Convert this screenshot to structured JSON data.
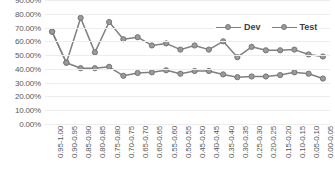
{
  "chart_data": {
    "type": "line",
    "title": "",
    "xlabel": "",
    "ylabel": "",
    "ylim": [
      0,
      0.9
    ],
    "grid": true,
    "legend_position": "top-right",
    "categories": [
      "0.95-1.00",
      "0.90-0.95",
      "0.85-0.90",
      "0.80-0.85",
      "0.75-0.80",
      "0.70-0.75",
      "0.65-0.70",
      "0.60-0.65",
      "0.55-0.60",
      "0.50-0.55",
      "0.45-0.50",
      "0.40-0.45",
      "0.35-0.40",
      "0.30-0.35",
      "0.25-0.30",
      "0.20-0.25",
      "0.15-0.20",
      "0.10-0.15",
      "0.05-0.10",
      "0.00-0.05"
    ],
    "ytick_labels": [
      "90.00%",
      "80.00%",
      "70.00%",
      "60.00%",
      "50.00%",
      "40.00%",
      "30.00%",
      "20.00%",
      "10.00%",
      "0.00%"
    ],
    "ytick_values": [
      0.9,
      0.8,
      0.7,
      0.6,
      0.5,
      0.4,
      0.3,
      0.2,
      0.1,
      0.0
    ],
    "series": [
      {
        "name": "Dev",
        "color": "#808080",
        "values": [
          0.67,
          0.445,
          0.405,
          0.405,
          0.415,
          0.35,
          0.37,
          0.375,
          0.39,
          0.365,
          0.385,
          0.385,
          0.36,
          0.34,
          0.345,
          0.345,
          0.355,
          0.375,
          0.365,
          0.33
        ]
      },
      {
        "name": "Test",
        "color": "#808080",
        "values": [
          0.67,
          0.445,
          0.77,
          0.52,
          0.74,
          0.615,
          0.63,
          0.57,
          0.585,
          0.54,
          0.57,
          0.54,
          0.6,
          0.485,
          0.56,
          0.535,
          0.535,
          0.54,
          0.505,
          0.49
        ]
      }
    ]
  }
}
